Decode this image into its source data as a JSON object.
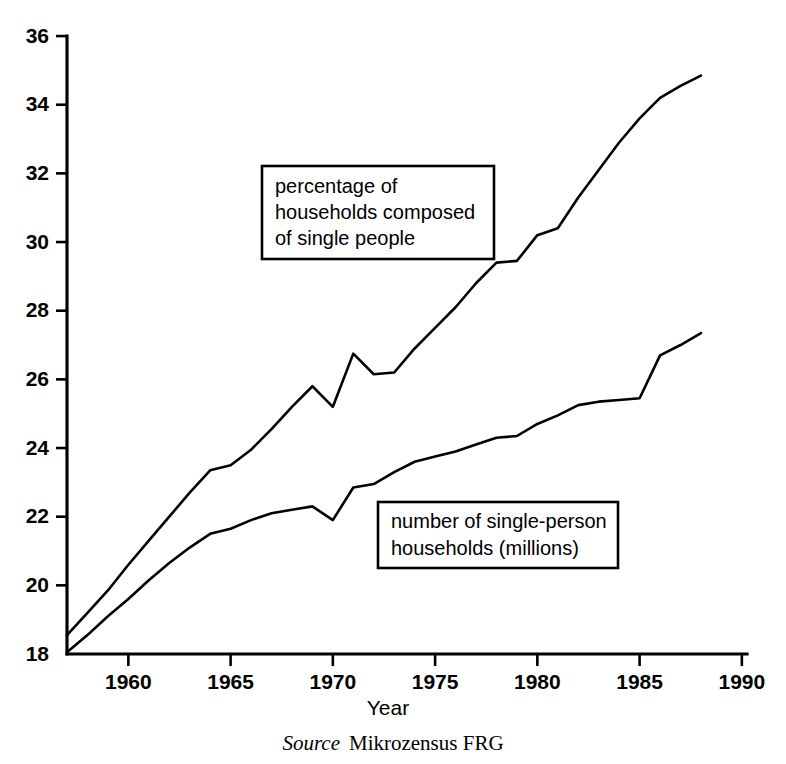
{
  "figure": {
    "source_prefix": "Source",
    "source_text": "Mikrozensus FRG"
  },
  "chart_data": {
    "type": "line",
    "title": "",
    "subtitle": "",
    "xlabel": "Year",
    "ylabel": "",
    "xlim": [
      1957,
      1990
    ],
    "ylim": [
      18,
      36
    ],
    "grid": false,
    "legend_position": "inline-callout-boxes",
    "xticks": [
      1960,
      1965,
      1970,
      1975,
      1980,
      1985,
      1990
    ],
    "xtick_labels": [
      "1960",
      "1965",
      "1970",
      "1975",
      "1980",
      "1985",
      "1990"
    ],
    "yticks": [
      18,
      20,
      22,
      24,
      26,
      28,
      30,
      32,
      34,
      36
    ],
    "ytick_labels": [
      "18",
      "20",
      "22",
      "24",
      "26",
      "28",
      "30",
      "32",
      "34",
      "36"
    ],
    "annotations": [
      {
        "name": "percentage-callout",
        "lines": [
          "percentage of",
          "households composed",
          "of single people"
        ],
        "box_x": 262,
        "box_y": 166,
        "box_w": 232,
        "box_h": 93
      },
      {
        "name": "number-callout",
        "lines": [
          "number of single-person",
          "households (millions)"
        ],
        "box_x": 378,
        "box_y": 502,
        "box_w": 240,
        "box_h": 66
      }
    ],
    "series": [
      {
        "name": "percentage of households composed of single people",
        "short_name": "percentage",
        "x": [
          1957,
          1958,
          1959,
          1960,
          1961,
          1962,
          1963,
          1964,
          1965,
          1966,
          1967,
          1968,
          1969,
          1970,
          1971,
          1972,
          1973,
          1974,
          1975,
          1976,
          1977,
          1978,
          1979,
          1980,
          1981,
          1982,
          1983,
          1984,
          1985,
          1986,
          1987,
          1988
        ],
        "values": [
          18.55,
          19.2,
          19.85,
          20.6,
          21.3,
          22.0,
          22.7,
          23.35,
          23.5,
          23.95,
          24.55,
          25.2,
          25.8,
          25.2,
          26.75,
          26.15,
          26.2,
          26.9,
          27.5,
          28.1,
          28.8,
          29.4,
          29.45,
          30.2,
          30.4,
          31.3,
          32.1,
          32.9,
          33.6,
          34.2,
          34.55,
          34.85
        ]
      },
      {
        "name": "number of single-person households (millions)",
        "short_name": "number",
        "x": [
          1957,
          1958,
          1959,
          1960,
          1961,
          1962,
          1963,
          1964,
          1965,
          1966,
          1967,
          1968,
          1969,
          1970,
          1971,
          1972,
          1973,
          1974,
          1975,
          1976,
          1977,
          1978,
          1979,
          1980,
          1981,
          1982,
          1983,
          1984,
          1985,
          1986,
          1987,
          1988
        ],
        "values": [
          18.05,
          18.55,
          19.1,
          19.6,
          20.15,
          20.65,
          21.1,
          21.5,
          21.65,
          21.9,
          22.1,
          22.2,
          22.3,
          21.9,
          22.85,
          22.95,
          23.3,
          23.6,
          23.75,
          23.9,
          24.1,
          24.3,
          24.35,
          24.7,
          24.95,
          25.25,
          25.35,
          25.4,
          25.45,
          26.7,
          27.0,
          27.35
        ]
      }
    ]
  },
  "plot_geometry": {
    "x_origin_px": 67,
    "y_bottom_px": 654,
    "px_per_year": 20.45,
    "px_per_unit": 34.33,
    "x_axis_end_px": 747,
    "y_axis_top_px": 36
  }
}
